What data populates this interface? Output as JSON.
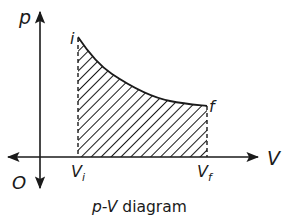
{
  "diagram": {
    "type": "p-V diagram",
    "caption": {
      "italic_part": "p-V",
      "text_part": " diagram"
    },
    "axes": {
      "y_label": "p",
      "x_label": "V",
      "origin_label": "O"
    },
    "points": {
      "initial": {
        "label": "i"
      },
      "final": {
        "label": "f"
      }
    },
    "tick_labels": {
      "v_initial": {
        "base": "V",
        "sub": "i"
      },
      "v_final": {
        "base": "V",
        "sub": "f"
      }
    },
    "region": {
      "description": "Hatched area under curve from Vi to Vf (work done)",
      "fill_style": "diagonal-hatch"
    },
    "colors": {
      "ink": "#1a1a1a",
      "background": "#ffffff"
    }
  }
}
